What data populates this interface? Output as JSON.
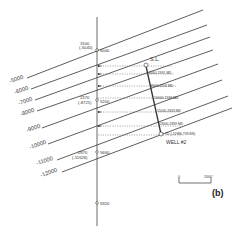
{
  "figure": {
    "panel_label": "(b)",
    "colors": {
      "line": "#333333",
      "background": "#ffffff",
      "projection": "#777777"
    }
  },
  "contours": [
    {
      "label": "-5000"
    },
    {
      "label": "-6000"
    },
    {
      "label": "-7000"
    },
    {
      "label": "-8000"
    },
    {
      "label": "-9000"
    },
    {
      "label": "-10000"
    },
    {
      "label": "-11000"
    },
    {
      "label": "-12000"
    }
  ],
  "section_points": [
    {
      "label_top": "1500",
      "label_bottom": "(-5040)",
      "station": "5040"
    },
    {
      "label_top": "2370",
      "label_bottom": "(-8721)",
      "station": "5200"
    },
    {
      "label_top": "2970",
      "label_bottom": "(-11626)",
      "station": "5660"
    },
    {
      "label_top": "",
      "label_bottom": "",
      "station": "5920"
    }
  ],
  "well": {
    "surface_label": "S.L.",
    "name": "WELL #2",
    "depth_marks": [
      {
        "label": "6000-1991 MD"
      },
      {
        "label": "8000-2114 MD"
      },
      {
        "label": "10000-2139 MD"
      },
      {
        "label": "11000-2633 MD"
      },
      {
        "label": "13000-2839 MD"
      },
      {
        "label": "TD (-11986 TVDSS)"
      }
    ]
  },
  "scale_bar": {
    "start": "0",
    "end": "2000'"
  }
}
